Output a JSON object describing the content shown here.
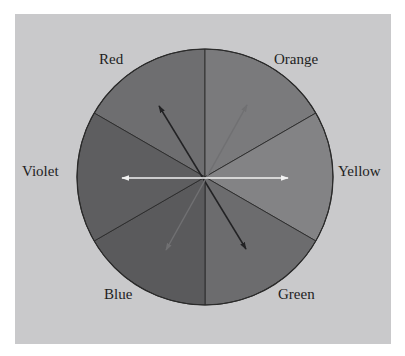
{
  "diagram": {
    "panel_color": "#c9c9cb",
    "circle": {
      "cx": 205,
      "cy": 177,
      "r": 128,
      "outline_color": "#2a2a2a"
    },
    "sectors": [
      {
        "name": "Red",
        "label": "Red",
        "start_deg": 90,
        "end_deg": 150,
        "fill": "#6e6e70"
      },
      {
        "name": "Orange",
        "label": "Orange",
        "start_deg": 30,
        "end_deg": 90,
        "fill": "#7a7a7c"
      },
      {
        "name": "Yellow",
        "label": "Yellow",
        "start_deg": -30,
        "end_deg": 30,
        "fill": "#838385"
      },
      {
        "name": "Green",
        "label": "Green",
        "start_deg": -90,
        "end_deg": -30,
        "fill": "#6c6c6e"
      },
      {
        "name": "Blue",
        "label": "Blue",
        "start_deg": -150,
        "end_deg": -90,
        "fill": "#5a5a5c"
      },
      {
        "name": "Violet",
        "label": "Violet",
        "start_deg": 150,
        "end_deg": 210,
        "fill": "#5e5e60"
      }
    ],
    "labels": {
      "red": "Red",
      "orange": "Orange",
      "yellow": "Yellow",
      "green": "Green",
      "blue": "Blue",
      "violet": "Violet"
    },
    "arrows": [
      {
        "name": "red-green",
        "from": "Red",
        "to": "Green",
        "color": "#222224",
        "x1": 159,
        "y1": 106,
        "x2": 246,
        "y2": 249,
        "double_headed": true
      },
      {
        "name": "orange-blue",
        "from": "Orange",
        "to": "Blue",
        "color": "#707072",
        "x1": 247,
        "y1": 105,
        "x2": 166,
        "y2": 250,
        "double_headed": true
      },
      {
        "name": "yellow-violet",
        "from": "Yellow",
        "to": "Violet",
        "color": "#f2f2f2",
        "x1": 122,
        "y1": 178,
        "x2": 288,
        "y2": 178,
        "double_headed": true
      }
    ]
  }
}
